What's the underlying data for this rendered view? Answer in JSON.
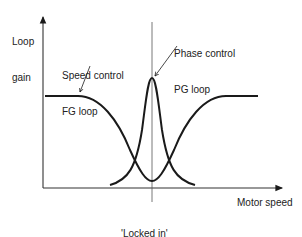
{
  "diagram": {
    "y_axis_label": [
      "Loop",
      "gain"
    ],
    "x_axis_label": "Motor speed",
    "curves": [
      {
        "name": "speed-control-fg-loop",
        "label": [
          "Speed control",
          "FG loop"
        ]
      },
      {
        "name": "phase-control-pg-loop",
        "label": [
          "Phase control",
          "PG loop"
        ]
      }
    ],
    "marker": {
      "label": [
        "'Locked in'",
        "speed & phase"
      ]
    },
    "colors": {
      "line": "#1a1a1a",
      "axis": "#333333",
      "marker_line": "#555555"
    }
  }
}
